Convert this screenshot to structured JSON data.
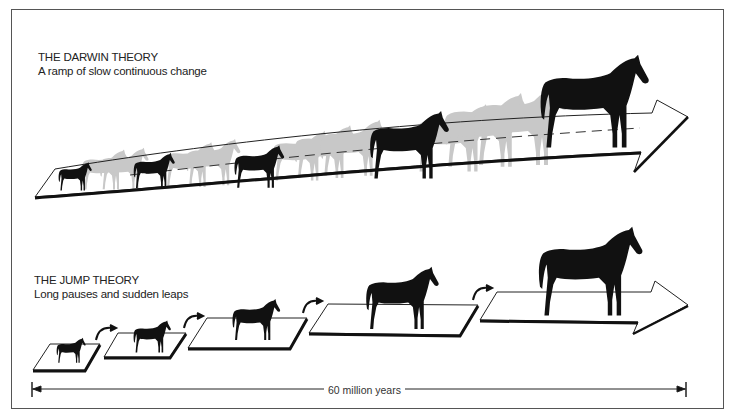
{
  "darwin": {
    "title": "THE DARWIN THEORY",
    "subtitle": "A ramp of slow continuous change",
    "highlighted_horses": 5,
    "ghost_color": "#c8c8c8",
    "horse_color": "#111111"
  },
  "jump": {
    "title": "THE JUMP THEORY",
    "subtitle": "Long pauses and sudden leaps",
    "platforms": 5,
    "horses": 5
  },
  "timeline": {
    "label": "60 million years",
    "start_icon": "arrow-left-icon",
    "end_icon": "arrow-right-icon"
  }
}
